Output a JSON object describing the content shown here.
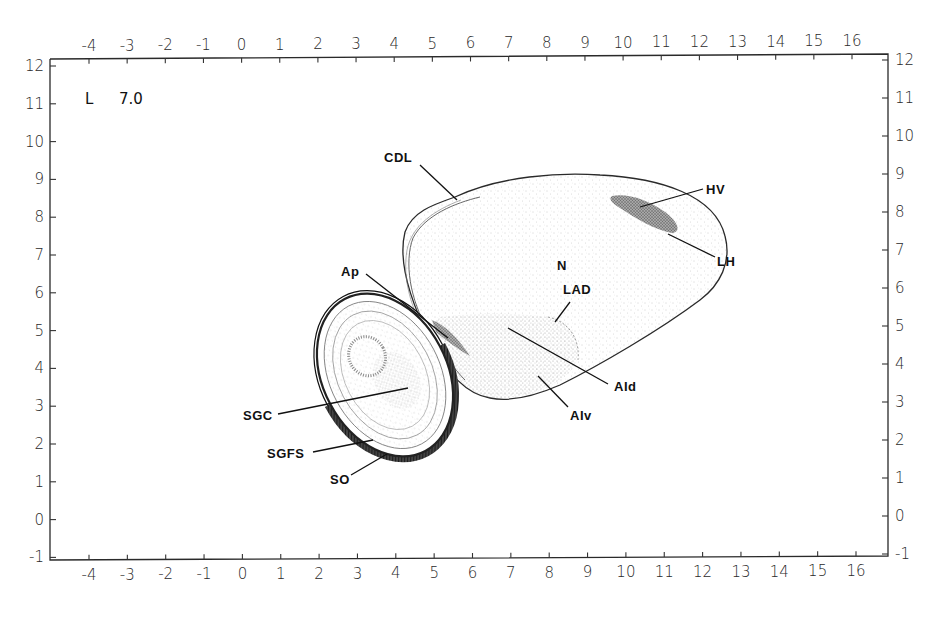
{
  "figure": {
    "plate_label": "L",
    "plate_value": "7.0"
  },
  "axes": {
    "x_ticks": [
      "-4",
      "-3",
      "-2",
      "-1",
      "0",
      "1",
      "2",
      "3",
      "4",
      "5",
      "6",
      "7",
      "8",
      "9",
      "10",
      "11",
      "12",
      "13",
      "14",
      "15",
      "16"
    ],
    "y_ticks": [
      "12",
      "11",
      "10",
      "9",
      "8",
      "7",
      "6",
      "5",
      "4",
      "3",
      "2",
      "1",
      "0",
      "-1"
    ],
    "x_range": [
      -5,
      17
    ],
    "y_range": [
      -1,
      12
    ]
  },
  "regions": {
    "cdl": "CDL",
    "hv": "HV",
    "lh": "LH",
    "n": "N",
    "lad": "LAD",
    "ap": "Ap",
    "aid": "AId",
    "aiv": "AIv",
    "sgc": "SGC",
    "sgfs": "SGFS",
    "so": "SO"
  },
  "colors": {
    "ink": "#1a1a1a",
    "stipple_light": "#cfcfcf",
    "stipple_dark": "#6a6a6a",
    "background": "#ffffff"
  }
}
